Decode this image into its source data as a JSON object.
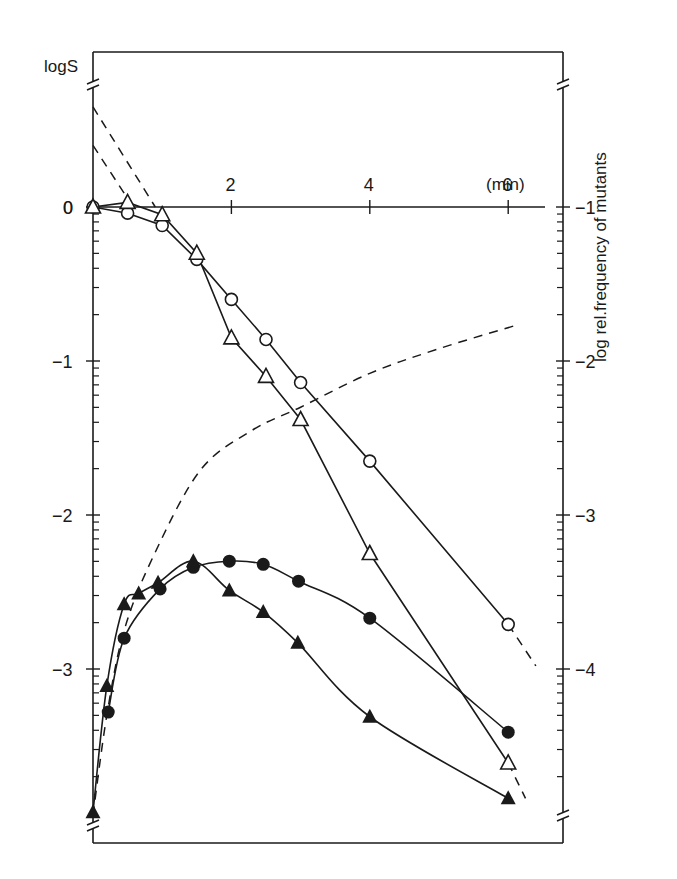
{
  "chart_data": {
    "type": "line",
    "title": "",
    "xlabel": "(min)",
    "ylabel": "logS",
    "ylabel_right": "log rel.frequency of mutants",
    "x_ticks": [
      2,
      4,
      6
    ],
    "x_origin_label": "0",
    "y_left_ticks": [
      0,
      -1,
      -2,
      -3
    ],
    "y_left_tick_labels": [
      "0",
      "-1",
      "-2",
      "-3"
    ],
    "y_right_ticks": [
      -1,
      -2,
      -3,
      -4
    ],
    "y_right_tick_labels": [
      "-1",
      "-2",
      "-3",
      "-4"
    ],
    "y_right_offset": -1,
    "xlim": [
      0,
      6.8
    ],
    "ylim_left": [
      -4.1,
      1.0
    ],
    "grid": false,
    "axis_breaks": true,
    "series": [
      {
        "name": "survival (open circles)",
        "axis": "left",
        "marker": "open-circle",
        "x": [
          0,
          0.5,
          1.0,
          1.5,
          2.0,
          2.5,
          3.0,
          4.0,
          6.0
        ],
        "y": [
          0,
          -0.04,
          -0.12,
          -0.34,
          -0.6,
          -0.86,
          -1.14,
          -1.65,
          -2.71
        ]
      },
      {
        "name": "survival (open triangles)",
        "axis": "left",
        "marker": "open-triangle",
        "x": [
          0,
          0.5,
          1.0,
          1.5,
          2.0,
          2.5,
          3.0,
          4.0,
          6.0
        ],
        "y": [
          0,
          0.03,
          -0.05,
          -0.3,
          -0.85,
          -1.1,
          -1.38,
          -2.25,
          -3.61
        ]
      },
      {
        "name": "mutant frequency (filled circles)",
        "axis": "right",
        "marker": "filled-circle",
        "x": [
          0.22,
          0.45,
          0.97,
          1.45,
          1.97,
          2.46,
          2.97,
          4.0,
          6.0
        ],
        "y_left_scale": [
          -3.28,
          -2.8,
          -2.48,
          -2.34,
          -2.3,
          -2.32,
          -2.43,
          -2.67,
          -3.41
        ]
      },
      {
        "name": "mutant frequency (filled triangles)",
        "axis": "right",
        "marker": "filled-triangle",
        "x": [
          0,
          0.2,
          0.45,
          0.66,
          0.94,
          1.45,
          1.97,
          2.46,
          2.96,
          4.0,
          6.0
        ],
        "y_left_scale": [
          -3.93,
          -3.11,
          -2.58,
          -2.51,
          -2.44,
          -2.3,
          -2.49,
          -2.63,
          -2.83,
          -3.31,
          -3.84
        ]
      }
    ],
    "dashed_lines": [
      {
        "name": "extrapolation-circles",
        "x": [
          0,
          0.9
        ],
        "y": [
          0.65,
          0
        ]
      },
      {
        "name": "extrapolation-triangles",
        "x": [
          0,
          0.58
        ],
        "y": [
          0.4,
          0
        ]
      },
      {
        "name": "extrapolation-circles-tail",
        "x": [
          6.0,
          6.4
        ],
        "y": [
          -2.71,
          -2.98
        ]
      },
      {
        "name": "extrapolation-triangles-tail",
        "x": [
          6.0,
          6.25
        ],
        "y": [
          -3.61,
          -3.84
        ]
      },
      {
        "name": "theoretical-mutant-curve",
        "x": [
          0,
          0.2,
          0.45,
          0.87,
          1.55,
          2.3,
          3.0,
          4.0,
          5.0,
          6.1
        ],
        "y": [
          -3.95,
          -3.3,
          -2.75,
          -2.27,
          -1.71,
          -1.45,
          -1.3,
          -1.08,
          -0.92,
          -0.77
        ]
      }
    ]
  },
  "labels": {
    "ylabel": "logS",
    "ylabel_right": "log rel.frequency of mutants",
    "xunit": "(min)",
    "origin": "0"
  }
}
